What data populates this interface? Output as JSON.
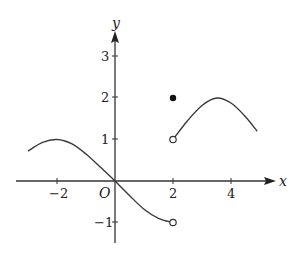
{
  "chart_data": {
    "type": "line",
    "title": "",
    "xlabel": "x",
    "ylabel": "y",
    "origin_label": "O",
    "xlim": [
      -3.4,
      5.5
    ],
    "ylim": [
      -1.5,
      3.6
    ],
    "grid": false,
    "legend": null,
    "x_ticks": [
      {
        "value": -2,
        "label": "−2"
      },
      {
        "value": 2,
        "label": "2"
      },
      {
        "value": 4,
        "label": "4"
      }
    ],
    "y_ticks": [
      {
        "value": 3,
        "label": "3"
      },
      {
        "value": 2,
        "label": "2"
      },
      {
        "value": 1,
        "label": "1"
      },
      {
        "value": -1,
        "label": "−1"
      }
    ],
    "series": [
      {
        "name": "left-branch",
        "domain": [
          -3,
          2
        ],
        "points": [
          [
            -3,
            0.72
          ],
          [
            -2.5,
            0.93
          ],
          [
            -2,
            1.0
          ],
          [
            -1.5,
            0.9
          ],
          [
            -1,
            0.65
          ],
          [
            -0.5,
            0.33
          ],
          [
            0,
            0
          ],
          [
            0.5,
            -0.35
          ],
          [
            1,
            -0.68
          ],
          [
            1.5,
            -0.9
          ],
          [
            2,
            -1.0
          ]
        ],
        "endpoint_right": {
          "x": 2,
          "y": -1,
          "style": "open"
        }
      },
      {
        "name": "right-branch",
        "domain": [
          2,
          4.9
        ],
        "points": [
          [
            2,
            1.0
          ],
          [
            2.5,
            1.45
          ],
          [
            3,
            1.82
          ],
          [
            3.5,
            2.0
          ],
          [
            4,
            1.88
          ],
          [
            4.5,
            1.55
          ],
          [
            4.9,
            1.2
          ]
        ],
        "endpoint_left": {
          "x": 2,
          "y": 1,
          "style": "open"
        }
      }
    ],
    "isolated_points": [
      {
        "x": 2,
        "y": 2,
        "style": "filled"
      }
    ]
  }
}
